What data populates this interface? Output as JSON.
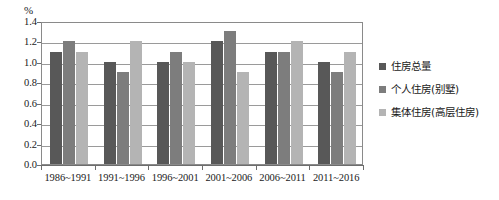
{
  "chart_data": {
    "type": "bar",
    "title": "",
    "xlabel": "",
    "ylabel": "%",
    "unit_label": "%",
    "ylim": [
      0.0,
      1.4
    ],
    "ytick_labels": [
      "0.0",
      "0.2",
      "0.4",
      "0.6",
      "0.8",
      "1.0",
      "1.2",
      "1.4"
    ],
    "ytick_values": [
      0.0,
      0.2,
      0.4,
      0.6,
      0.8,
      1.0,
      1.2,
      1.4
    ],
    "grid": true,
    "legend_position": "right",
    "categories": [
      "1986~1991",
      "1991~1996",
      "1996~2001",
      "2001~2006",
      "2006~2011",
      "2011~2016"
    ],
    "series": [
      {
        "name": "住房总量",
        "color": "#585858",
        "values": [
          1.1,
          1.0,
          1.0,
          1.2,
          1.1,
          1.0
        ]
      },
      {
        "name": "个人住房(别墅)",
        "color": "#7d7d7d",
        "values": [
          1.2,
          0.9,
          1.1,
          1.3,
          1.1,
          0.9
        ]
      },
      {
        "name": "集体住房(高层住房)",
        "color": "#b4b4b4",
        "values": [
          1.1,
          1.2,
          1.0,
          0.9,
          1.2,
          1.1
        ]
      }
    ]
  }
}
